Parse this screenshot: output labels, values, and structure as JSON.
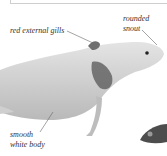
{
  "figure": {
    "labels": [
      {
        "id": "gills",
        "text": "red external gills"
      },
      {
        "id": "snout_line1",
        "text": "rounded"
      },
      {
        "id": "snout_line2",
        "text": "snout"
      },
      {
        "id": "body_line1",
        "text": "smooth"
      },
      {
        "id": "body_line2",
        "text": "white body"
      }
    ]
  }
}
